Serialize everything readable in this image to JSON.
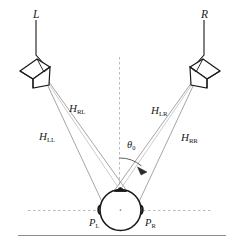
{
  "figure": {
    "colors": {
      "stroke": "#1a1a1a",
      "ray": "#8a8a8a",
      "dashed": "#b4b4b4",
      "background": "#ffffff",
      "rule": "#8c8c8c"
    },
    "sources": [
      {
        "id": "left",
        "label": "L",
        "icon": "loudspeaker-icon"
      },
      {
        "id": "right",
        "label": "R",
        "icon": "loudspeaker-icon"
      }
    ],
    "transfer_paths": [
      {
        "id": "HLL",
        "base": "H",
        "sub": "LL",
        "from": "left",
        "to": "P_L",
        "label": "H_LL"
      },
      {
        "id": "HRL",
        "base": "H",
        "sub": "RL",
        "from": "left",
        "to": "P_R",
        "label": "H_RL"
      },
      {
        "id": "HLR",
        "base": "H",
        "sub": "LR",
        "from": "right",
        "to": "P_L",
        "label": "H_LR"
      },
      {
        "id": "HRR",
        "base": "H",
        "sub": "RR",
        "from": "right",
        "to": "P_R",
        "label": "H_RR"
      }
    ],
    "ears": [
      {
        "id": "PL",
        "base": "P",
        "sub": "L",
        "label": "P_L"
      },
      {
        "id": "PR",
        "base": "P",
        "sub": "R",
        "label": "P_R"
      }
    ],
    "angle": {
      "symbol": "θ",
      "sub": "0",
      "label": "θ_0",
      "description": "loudspeaker-span-half-angle"
    },
    "axes": {
      "vertical_dashed": "median-plane-reference",
      "horizontal_dashed": "interaural-axis-reference"
    },
    "listener": {
      "id": "head",
      "description": "listener-head-top-view"
    }
  }
}
